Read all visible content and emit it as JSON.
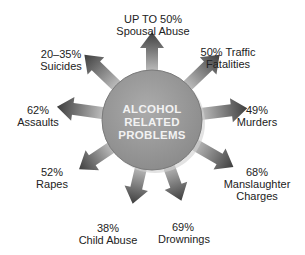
{
  "center": {
    "lines": [
      "ALCOHOL",
      "RELATED",
      "PROBLEMS"
    ]
  },
  "labels": [
    {
      "id": "spousal-abuse",
      "pct": "UP TO 50%",
      "text": "Spousal Abuse"
    },
    {
      "id": "traffic-fatalities",
      "pct": "50% Traffic",
      "text": "Fatalities"
    },
    {
      "id": "murders",
      "pct": "49%",
      "text": "Murders"
    },
    {
      "id": "manslaughter",
      "pct": "68%",
      "text": "Manslaughter",
      "text2": "Charges"
    },
    {
      "id": "drownings",
      "pct": "69%",
      "text": "Drownings"
    },
    {
      "id": "child-abuse",
      "pct": "38%",
      "text": "Child Abuse"
    },
    {
      "id": "rapes",
      "pct": "52%",
      "text": "Rapes"
    },
    {
      "id": "assaults",
      "pct": "62%",
      "text": "Assaults"
    },
    {
      "id": "suicides",
      "pct": "20–35%",
      "text": "Suicides"
    }
  ],
  "colors": {
    "circle": "#9a9a9a",
    "arrow_dark": "#4a4a4a",
    "arrow_light": "#bdbdbd",
    "text": "#222222",
    "center_text": "#f2f2f2"
  }
}
